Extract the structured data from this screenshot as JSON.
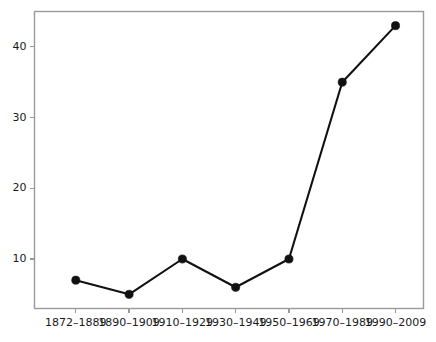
{
  "chart_data": {
    "type": "line",
    "title": "",
    "subtitle": "",
    "xlabel": "",
    "ylabel": "",
    "categories": [
      "1872–1889",
      "1890–1909",
      "1910–1929",
      "1930–1949",
      "1950–1969",
      "1970–1989",
      "1990–2009"
    ],
    "values": [
      7,
      5,
      10,
      6,
      10,
      35,
      43
    ],
    "series": [
      {
        "name": "count",
        "values": [
          7,
          5,
          10,
          6,
          10,
          35,
          43
        ]
      }
    ],
    "ylim": [
      3,
      45
    ],
    "yticks": [
      10,
      20,
      30,
      40
    ],
    "ytick_labels": [
      "10",
      "20",
      "30",
      "40"
    ],
    "xtick_labels": [
      "1872–1889",
      "1890–1909",
      "1910–1929",
      "1930–1949",
      "1950–1969",
      "1970–1989",
      "1990–2009"
    ],
    "grid": true,
    "grid_axis": "both",
    "legend": false,
    "legend_position": "none",
    "marker": "circle",
    "line_color": "#111111",
    "marker_color": "#111111",
    "grid_color": "#e8e8e8",
    "axis_color": "#9a9a9a",
    "background": "#ffffff",
    "annotations": []
  }
}
